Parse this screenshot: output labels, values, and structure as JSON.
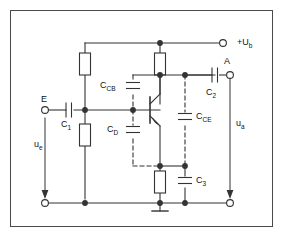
{
  "diagram": {
    "type": "schematic",
    "background_color": "#ffffff",
    "border_color": "#4a4a4a",
    "wire_color": "#333333",
    "dashed_color": "#444444"
  },
  "terminals": {
    "supply": {
      "label_main": "+U",
      "label_sub": "b",
      "name": "supply-terminal"
    },
    "input": {
      "label": "E",
      "name": "input-terminal"
    },
    "output": {
      "label": "A",
      "name": "output-terminal"
    },
    "input_return": {
      "label": "",
      "name": "input-return-terminal"
    },
    "output_return": {
      "label": "",
      "name": "output-return-terminal"
    }
  },
  "voltages": {
    "input": {
      "main": "u",
      "sub": "e"
    },
    "output": {
      "main": "u",
      "sub": "a"
    }
  },
  "capacitors": [
    {
      "id": "c1",
      "main": "C",
      "sub": "1",
      "style": "solid",
      "orientation": "horizontal"
    },
    {
      "id": "c2",
      "main": "C",
      "sub": "2",
      "style": "solid",
      "orientation": "horizontal"
    },
    {
      "id": "c3",
      "main": "C",
      "sub": "3",
      "style": "solid",
      "orientation": "vertical"
    },
    {
      "id": "ccb",
      "main": "C",
      "sub": "CB",
      "style": "dashed",
      "orientation": "vertical"
    },
    {
      "id": "cd",
      "main": "C",
      "sub": "D",
      "style": "dashed",
      "orientation": "vertical"
    },
    {
      "id": "cce",
      "main": "C",
      "sub": "CE",
      "style": "dashed",
      "orientation": "vertical"
    }
  ],
  "resistors": [
    {
      "id": "r-base",
      "name": "base-bias-resistor-upper"
    },
    {
      "id": "r-base-lower",
      "name": "base-bias-resistor-lower"
    },
    {
      "id": "r-collector",
      "name": "collector-resistor"
    },
    {
      "id": "r-emitter",
      "name": "emitter-resistor"
    }
  ],
  "transistor": {
    "type": "npn",
    "name": "npn-transistor"
  },
  "ground": {
    "name": "ground-symbol"
  }
}
